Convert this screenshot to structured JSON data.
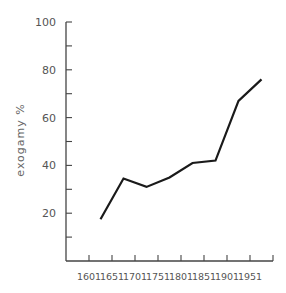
{
  "chart_data": {
    "type": "line",
    "title": "",
    "xlabel": "",
    "ylabel": "exogamy %",
    "x_tick_labels": [
      "1601",
      "1651",
      "1701",
      "1751",
      "1801",
      "1851",
      "1901",
      "1951"
    ],
    "y_tick_labels": [
      "20",
      "40",
      "60",
      "80",
      "100"
    ],
    "ylim": [
      0,
      100
    ],
    "xlim": [
      1601,
      2001
    ],
    "grid": false,
    "legend": null,
    "series": [
      {
        "name": "exogamy",
        "x": [
          1626,
          1676,
          1726,
          1776,
          1826,
          1876,
          1926,
          1976
        ],
        "values": [
          17.5,
          34.5,
          31,
          35,
          41,
          42,
          67,
          76
        ]
      }
    ]
  },
  "colors": {
    "line": "#1a1a1a",
    "axis": "#444444",
    "text": "#555555"
  }
}
